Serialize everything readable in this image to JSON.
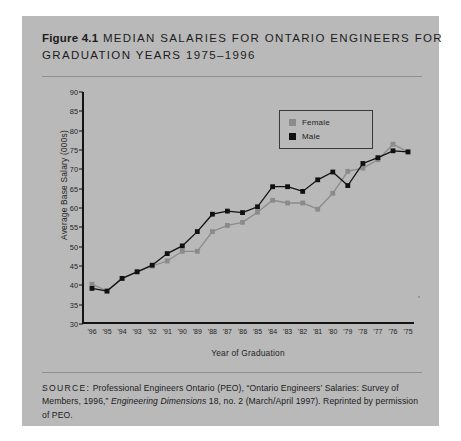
{
  "figure": {
    "label": "Figure 4.1",
    "title_line1": "MEDIAN SALARIES FOR ONTARIO ENGINEERS FOR",
    "title_line2": "GRADUATION YEARS 1975–1996",
    "source_label": "SOURCE:",
    "source_text_1": " Professional Engineers Ontario (PEO), “Ontario Engineers’ Salaries: Survey of Members, 1996,” ",
    "source_italic": "Engineering Dimensions",
    "source_text_2": " 18, no. 2 (March/April 1997). Reprinted by permission of PEO.",
    "background_color": "#b9b9b9"
  },
  "legend": {
    "position": "top-center-right",
    "entries": [
      {
        "label": "Female",
        "color": "#8b8b8b"
      },
      {
        "label": "Male",
        "color": "#111111"
      }
    ]
  },
  "chart_data": {
    "type": "line",
    "xlabel": "Year of Graduation",
    "ylabel": "Average Base Salary (000s)",
    "ylim": [
      30,
      90
    ],
    "yticks": [
      30,
      35,
      40,
      45,
      50,
      55,
      60,
      65,
      70,
      75,
      80,
      85,
      90
    ],
    "grid": false,
    "legend_position": "top-right",
    "categories": [
      "'96",
      "'95",
      "'94",
      "'93",
      "'92",
      "'91",
      "'90",
      "'89",
      "'88",
      "'87",
      "'86",
      "'85",
      "'84",
      "'83",
      "'82",
      "'81",
      "'80",
      "'79",
      "'78",
      "'77",
      "'76",
      "'75"
    ],
    "series": [
      {
        "name": "Female",
        "color": "#8b8b8b",
        "values": [
          40.3,
          38.5,
          41.8,
          43.5,
          45.0,
          46.3,
          48.8,
          48.8,
          53.9,
          55.5,
          56.3,
          58.9,
          62.0,
          61.3,
          61.3,
          59.7,
          63.8,
          69.5,
          70.3,
          72.5,
          76.5,
          74.5
        ]
      },
      {
        "name": "Male",
        "color": "#111111",
        "values": [
          39.2,
          38.5,
          41.8,
          43.5,
          45.2,
          48.2,
          50.2,
          53.9,
          58.4,
          59.2,
          58.8,
          60.3,
          65.5,
          65.5,
          64.3,
          67.3,
          69.3,
          65.8,
          71.5,
          73.0,
          74.8,
          74.5
        ]
      }
    ]
  }
}
